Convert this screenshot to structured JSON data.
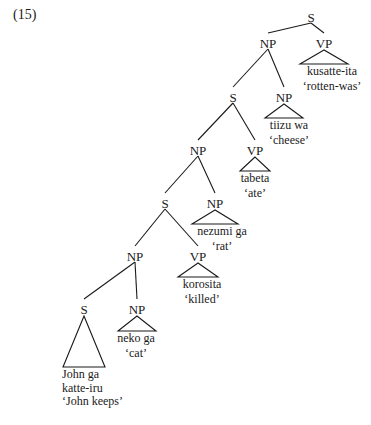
{
  "example_number": "(15)",
  "tree": {
    "nodes": [
      {
        "id": "s1",
        "label": "S"
      },
      {
        "id": "np1",
        "label": "NP"
      },
      {
        "id": "vp1",
        "label": "VP"
      },
      {
        "id": "s2",
        "label": "S"
      },
      {
        "id": "np2",
        "label": "NP"
      },
      {
        "id": "np3",
        "label": "NP"
      },
      {
        "id": "vp3",
        "label": "VP"
      },
      {
        "id": "s4",
        "label": "S"
      },
      {
        "id": "np4",
        "label": "NP"
      },
      {
        "id": "np5",
        "label": "NP"
      },
      {
        "id": "vp5",
        "label": "VP"
      },
      {
        "id": "s6",
        "label": "S"
      },
      {
        "id": "np6",
        "label": "NP"
      }
    ],
    "edges": [
      [
        "s1",
        "np1"
      ],
      [
        "s1",
        "vp1"
      ],
      [
        "np1",
        "s2"
      ],
      [
        "np1",
        "np2"
      ],
      [
        "s2",
        "np3"
      ],
      [
        "s2",
        "vp3"
      ],
      [
        "np3",
        "s4"
      ],
      [
        "np3",
        "np4"
      ],
      [
        "s4",
        "np5"
      ],
      [
        "s4",
        "vp5"
      ],
      [
        "np5",
        "s6"
      ],
      [
        "np5",
        "np6"
      ]
    ],
    "leaves": [
      {
        "parent": "vp1",
        "lines": [
          "kusatte-ita",
          "‘rotten-was’"
        ]
      },
      {
        "parent": "np2",
        "lines": [
          "tiizu wa",
          "‘cheese’"
        ]
      },
      {
        "parent": "vp3",
        "lines": [
          "tabeta",
          "‘ate’"
        ]
      },
      {
        "parent": "np4",
        "lines": [
          "nezumi ga",
          "‘rat’"
        ]
      },
      {
        "parent": "vp5",
        "lines": [
          "korosita",
          "‘killed’"
        ]
      },
      {
        "parent": "np6",
        "lines": [
          "neko ga",
          "‘cat’"
        ]
      },
      {
        "parent": "s6",
        "lines": [
          "John ga",
          "katte-iru",
          "‘John keeps’"
        ]
      }
    ]
  }
}
